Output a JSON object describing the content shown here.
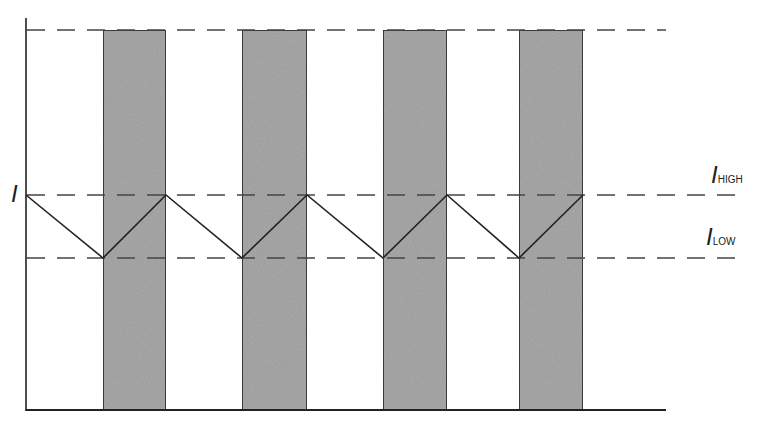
{
  "diagram": {
    "type": "current-ripple-waveform",
    "colors": {
      "band_fill": "#a9a9a9",
      "line": "#222222",
      "dash": "#444444",
      "background": "#ffffff"
    },
    "axis": {
      "y_label": "I"
    },
    "levels": [
      {
        "name": "top",
        "label": "",
        "y": 30
      },
      {
        "name": "high",
        "label_main": "I",
        "label_sub": "HIGH",
        "y": 195
      },
      {
        "name": "low",
        "label_main": "I",
        "label_sub": "LOW",
        "y": 258
      }
    ],
    "bands": [
      {
        "x0": 103,
        "x1": 166
      },
      {
        "x0": 242,
        "x1": 307
      },
      {
        "x0": 383,
        "x1": 447
      },
      {
        "x0": 519,
        "x1": 583
      }
    ],
    "waveform_points": [
      [
        26,
        195
      ],
      [
        103,
        258
      ],
      [
        166,
        195
      ],
      [
        242,
        258
      ],
      [
        307,
        195
      ],
      [
        383,
        258
      ],
      [
        447,
        195
      ],
      [
        519,
        258
      ],
      [
        583,
        195
      ]
    ]
  }
}
